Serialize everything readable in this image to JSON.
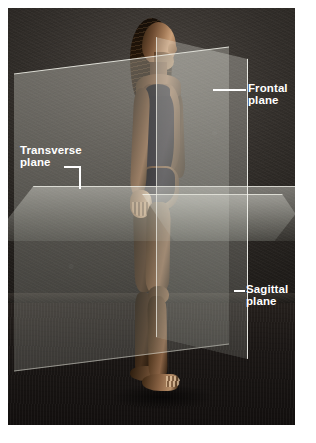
{
  "figure": {
    "alt": "Woman standing upright with three translucent planes intersecting her body"
  },
  "labels": {
    "frontal": "Frontal\nplane",
    "frontal_line1": "Frontal",
    "frontal_line2": "plane",
    "transverse_line1": "Transverse",
    "transverse_line2": "plane",
    "sagittal_line1": "Sagittal",
    "sagittal_line2": "plane"
  },
  "credit": {
    "text": "© McGraw-Hill Education/Joe De Grandis, photographer"
  },
  "colors": {
    "page_background": "#ffffff",
    "backdrop_dark": "#241f1c",
    "backdrop_highlight": "#4a4540",
    "plane_fill": "rgba(226,226,216,0.30)",
    "plane_edge": "#fcfcf6",
    "label_text": "#ffffff",
    "credit_text": "#2b2b2b"
  },
  "planes": [
    {
      "name": "frontal",
      "alias": "coronal",
      "orientation": "vertical, divides body into anterior and posterior"
    },
    {
      "name": "transverse",
      "alias": "horizontal",
      "orientation": "horizontal, divides body into superior and inferior"
    },
    {
      "name": "sagittal",
      "alias": "median",
      "orientation": "vertical, divides body into left and right"
    }
  ]
}
